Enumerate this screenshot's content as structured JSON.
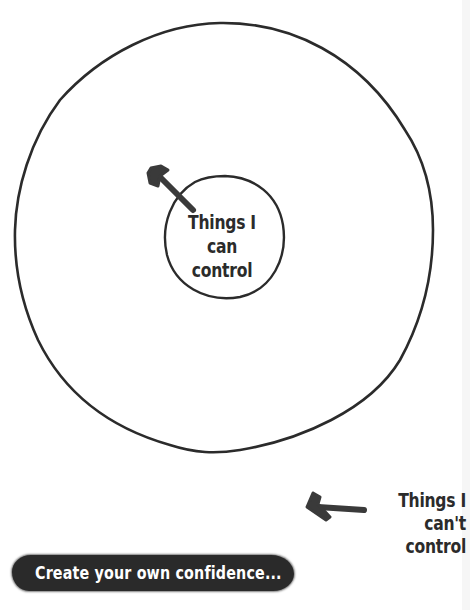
{
  "diagram": {
    "type": "circle-of-control",
    "inner_circle": {
      "label_line1": "Things I can",
      "label_line2": "control"
    },
    "outer_area": {
      "label_line1": "Things I",
      "label_line2": "can't control"
    },
    "banner": {
      "text": "Create your own confidence..."
    },
    "colors": {
      "stroke": "#2b2b2b",
      "background": "#ffffff",
      "banner_bg": "#2a2a2a",
      "banner_text": "#ffffff"
    }
  }
}
